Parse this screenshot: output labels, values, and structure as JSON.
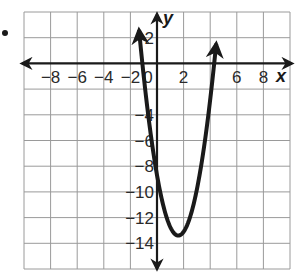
{
  "chart_data": {
    "type": "line",
    "title": "",
    "xlabel": "x",
    "ylabel": "y",
    "xlim": [
      -10,
      10
    ],
    "ylim": [
      -16,
      4
    ],
    "grid": true,
    "grid_step": 2,
    "x_ticks": [
      -8,
      -6,
      -4,
      -2,
      2,
      6,
      8
    ],
    "x_tick_labels": [
      "−8",
      "−6",
      "−4",
      "−2",
      "2",
      "6",
      "8"
    ],
    "y_ticks": [
      2,
      -4,
      -6,
      -8,
      -10,
      -12,
      -14
    ],
    "y_tick_labels": [
      "2",
      "−4",
      "−6",
      "−8",
      "−10",
      "−12",
      "−14"
    ],
    "origin_label": "0",
    "series": [
      {
        "name": "parabola",
        "equation_estimate": "y = 1.84(x - 1.6)^2 - 13.4",
        "vertex": [
          1.6,
          -13.4
        ],
        "x_intercepts": [
          -1.1,
          4.3
        ],
        "y_intercept": -8.7,
        "x_range": [
          -1.35,
          4.45
        ],
        "arrows_both_ends": true
      }
    ]
  },
  "bullet": "•"
}
